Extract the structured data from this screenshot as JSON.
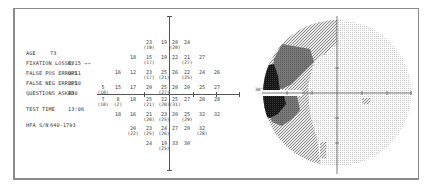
{
  "report": {
    "info": [
      {
        "label": "AGE",
        "value": "73"
      },
      {
        "label": "FIXATION LOSSES",
        "value": "6/15 →→"
      },
      {
        "label": "FALSE POS ERRORS",
        "value": "0/11"
      },
      {
        "label": "FALSE NEG ERRORS",
        "value": "2/10"
      },
      {
        "label": "QUESTIONS ASKED",
        "value": "430"
      },
      {
        "label": "TEST TIME",
        "value": "13:06"
      },
      {
        "label": "HFA S/N",
        "value": "640-1793"
      }
    ],
    "greyscale_axis_label": "30°",
    "colors": {
      "frame": "#8a8a8a",
      "axis": "#555555",
      "dense": "#111111",
      "dark": "#6e6e6e",
      "medium": "#9a9a9a",
      "light": "#cfcfcf",
      "lightest": "#e4e4e4"
    }
  },
  "chart_data": {
    "type": "table",
    "rows": [
      {
        "y": 43,
        "cells": [
          {
            "x": 149,
            "v": "23",
            "r": "(19)"
          },
          {
            "x": 164,
            "v": "19"
          },
          {
            "x": 175,
            "v": "20",
            "r": "(20)"
          },
          {
            "x": 187,
            "v": "24"
          }
        ]
      },
      {
        "y": 58,
        "cells": [
          {
            "x": 133,
            "v": "18"
          },
          {
            "x": 149,
            "v": "15",
            "r": "(17)"
          },
          {
            "x": 164,
            "v": "19"
          },
          {
            "x": 175,
            "v": "22"
          },
          {
            "x": 187,
            "v": "21",
            "r": "(27)"
          },
          {
            "x": 202,
            "v": "27"
          }
        ]
      },
      {
        "y": 73,
        "cells": [
          {
            "x": 118,
            "v": "16"
          },
          {
            "x": 133,
            "v": "12"
          },
          {
            "x": 149,
            "v": "23",
            "r": "(17)"
          },
          {
            "x": 164,
            "v": "25",
            "r": "(21)"
          },
          {
            "x": 175,
            "v": "26"
          },
          {
            "x": 187,
            "v": "22",
            "r": "(25)"
          },
          {
            "x": 202,
            "v": "24"
          },
          {
            "x": 217,
            "v": "26"
          }
        ]
      },
      {
        "y": 88,
        "cells": [
          {
            "x": 103,
            "v": "5",
            "r": "(10)"
          },
          {
            "x": 118,
            "v": "15"
          },
          {
            "x": 133,
            "v": "17"
          },
          {
            "x": 149,
            "v": "20"
          },
          {
            "x": 164,
            "v": "25",
            "r": "(27)"
          },
          {
            "x": 175,
            "v": "20"
          },
          {
            "x": 187,
            "v": "20"
          },
          {
            "x": 202,
            "v": "25"
          },
          {
            "x": 217,
            "v": "27"
          }
        ]
      },
      {
        "y": 100,
        "cells": [
          {
            "x": 103,
            "v": "7",
            "r": "(10)"
          },
          {
            "x": 118,
            "v": "8",
            "r": "(2)"
          },
          {
            "x": 133,
            "v": "18"
          },
          {
            "x": 149,
            "v": "25",
            "r": "(21)"
          },
          {
            "x": 164,
            "v": "22",
            "r": "(20)"
          },
          {
            "x": 175,
            "v": "25",
            "r": "(31)"
          },
          {
            "x": 187,
            "v": "27"
          },
          {
            "x": 202,
            "v": "28"
          },
          {
            "x": 217,
            "v": "28"
          }
        ]
      },
      {
        "y": 115,
        "cells": [
          {
            "x": 118,
            "v": "18"
          },
          {
            "x": 133,
            "v": "16"
          },
          {
            "x": 149,
            "v": "21",
            "r": "(20)"
          },
          {
            "x": 164,
            "v": "23",
            "r": "(25)"
          },
          {
            "x": 175,
            "v": "20"
          },
          {
            "x": 187,
            "v": "25",
            "r": "(29)"
          },
          {
            "x": 202,
            "v": "32"
          },
          {
            "x": 217,
            "v": "32"
          }
        ]
      },
      {
        "y": 129,
        "cells": [
          {
            "x": 133,
            "v": "20",
            "r": "(22)"
          },
          {
            "x": 149,
            "v": "23",
            "r": "(25)"
          },
          {
            "x": 164,
            "v": "24",
            "r": "(26)"
          },
          {
            "x": 175,
            "v": "27"
          },
          {
            "x": 187,
            "v": "29"
          },
          {
            "x": 202,
            "v": "32",
            "r": "(28)"
          }
        ]
      },
      {
        "y": 144,
        "cells": [
          {
            "x": 149,
            "v": "24"
          },
          {
            "x": 164,
            "v": "19",
            "r": "(25)"
          },
          {
            "x": 175,
            "v": "33"
          },
          {
            "x": 187,
            "v": "30"
          }
        ]
      }
    ],
    "axis_range_degrees": [
      -30,
      30
    ],
    "grid": false,
    "legend": null
  }
}
